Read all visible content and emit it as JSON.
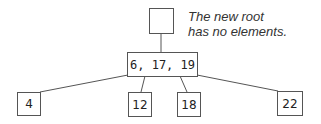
{
  "diagram": {
    "type": "b-tree",
    "root": {
      "label": "",
      "keys": []
    },
    "caption": {
      "line1": "The new root",
      "line2": "has no elements."
    },
    "internal_node": {
      "label": "6, 17, 19",
      "keys": [
        6,
        17,
        19
      ]
    },
    "leaves": [
      {
        "label": "4"
      },
      {
        "label": "12"
      },
      {
        "label": "18"
      },
      {
        "label": "22"
      }
    ],
    "colors": {
      "stroke": "#555555",
      "text": "#222222",
      "background": "#ffffff"
    }
  }
}
